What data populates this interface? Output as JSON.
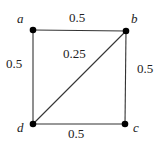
{
  "graph": {
    "nodes": [
      {
        "id": "a",
        "label": "a",
        "x": 33,
        "y": 30
      },
      {
        "id": "b",
        "label": "b",
        "x": 126,
        "y": 31
      },
      {
        "id": "c",
        "label": "c",
        "x": 125,
        "y": 124
      },
      {
        "id": "d",
        "label": "d",
        "x": 33,
        "y": 124
      }
    ],
    "edges": [
      {
        "from": "a",
        "to": "b",
        "weight": "0.5"
      },
      {
        "from": "b",
        "to": "c",
        "weight": "0.5"
      },
      {
        "from": "d",
        "to": "c",
        "weight": "0.5"
      },
      {
        "from": "a",
        "to": "d",
        "weight": "0.5"
      },
      {
        "from": "d",
        "to": "b",
        "weight": "0.25"
      }
    ],
    "colors": {
      "edge": "#333333",
      "node": "#000000",
      "label": "#222222"
    }
  }
}
